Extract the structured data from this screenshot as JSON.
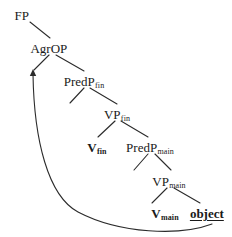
{
  "diagram": {
    "type": "syntactic-tree",
    "title": "",
    "background_color": "#ffffff",
    "line_color": "#2b2b2b",
    "text_color": "#1a1a1a"
  },
  "nodes": {
    "fp": {
      "base": "FP",
      "sub": "",
      "x": 22,
      "y": 14,
      "bold": false,
      "underlined": false
    },
    "agrop": {
      "base": "AgrOP",
      "sub": "",
      "x": 49,
      "y": 47,
      "bold": false,
      "underlined": false
    },
    "predp_fin": {
      "base": "PredP",
      "sub": "fin",
      "x": 84,
      "y": 80,
      "bold": false,
      "underlined": false
    },
    "vp_fin": {
      "base": "VP",
      "sub": "fin",
      "x": 117,
      "y": 113,
      "bold": false,
      "underlined": false
    },
    "v_fin": {
      "base": "V",
      "sub": "fin",
      "x": 97,
      "y": 146,
      "bold": true,
      "underlined": false
    },
    "predp_main": {
      "base": "PredP",
      "sub": "main",
      "x": 150,
      "y": 146,
      "bold": false,
      "underlined": false
    },
    "vp_main": {
      "base": "VP",
      "sub": "main",
      "x": 169,
      "y": 180,
      "bold": false,
      "underlined": false
    },
    "v_main": {
      "base": "V",
      "sub": "main",
      "x": 165,
      "y": 212,
      "bold": true,
      "underlined": false
    },
    "object": {
      "base": "object",
      "sub": "",
      "x": 207,
      "y": 212,
      "bold": true,
      "underlined": true
    }
  },
  "branches": [
    {
      "name": "fp-to-agrop",
      "x1": 30,
      "y1": 22,
      "x2": 50,
      "y2": 38
    },
    {
      "name": "agrop-to-spec",
      "x1": 49,
      "y1": 55,
      "x2": 34,
      "y2": 70
    },
    {
      "name": "agrop-to-predp-fin",
      "x1": 56,
      "y1": 55,
      "x2": 84,
      "y2": 71
    },
    {
      "name": "predp-fin-to-vp-fin",
      "x1": 84,
      "y1": 88,
      "x2": 70,
      "y2": 103
    },
    {
      "name": "predp-fin-to-vp-fin-right",
      "x1": 90,
      "y1": 88,
      "x2": 117,
      "y2": 104
    },
    {
      "name": "vp-fin-to-v-fin",
      "x1": 115,
      "y1": 121,
      "x2": 98,
      "y2": 137
    },
    {
      "name": "vp-fin-to-predp-main",
      "x1": 121,
      "y1": 121,
      "x2": 148,
      "y2": 137
    },
    {
      "name": "predp-main-to-left",
      "x1": 148,
      "y1": 154,
      "x2": 134,
      "y2": 170
    },
    {
      "name": "predp-main-to-vp-main",
      "x1": 155,
      "y1": 154,
      "x2": 171,
      "y2": 170
    },
    {
      "name": "vp-main-to-v-main",
      "x1": 167,
      "y1": 188,
      "x2": 152,
      "y2": 203
    },
    {
      "name": "vp-main-to-object",
      "x1": 174,
      "y1": 188,
      "x2": 200,
      "y2": 203
    }
  ],
  "movement_arrow": {
    "name": "object-to-spec-agrop",
    "path": "M 212 224 C 180 236 120 234 78 212 C 48 196 34 140 33 74",
    "arrowhead_tip_x": 33,
    "arrowhead_tip_y": 69,
    "description": "object raises to specifier of AgrOP"
  }
}
